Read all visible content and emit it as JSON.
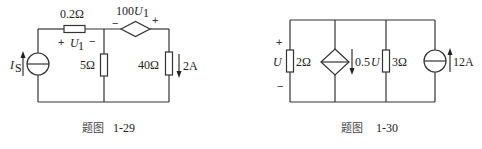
{
  "figures": [
    {
      "id": "fig-1-29",
      "caption_prefix": "题图",
      "caption_number": "1-29",
      "components": {
        "current_source": {
          "label_main": "I",
          "label_sub": "S",
          "direction": "up"
        },
        "series_resistor": {
          "value": "0.2Ω",
          "voltage_label_main": "U",
          "voltage_label_sub": "1",
          "plus": "+",
          "minus": "−"
        },
        "shunt_resistor": {
          "value": "5Ω"
        },
        "dependent_voltage_source": {
          "label_prefix": "100",
          "label_main": "U",
          "label_sub": "1",
          "minus": "−",
          "plus": "+"
        },
        "load_resistor": {
          "value": "40Ω",
          "current_label": "2A",
          "current_direction": "down"
        }
      }
    },
    {
      "id": "fig-1-30",
      "caption_prefix": "题图",
      "caption_number": "1-30",
      "components": {
        "voltage_label": {
          "main": "U",
          "plus": "+",
          "minus": "−"
        },
        "resistor_1": {
          "value": "2Ω"
        },
        "dependent_current_source": {
          "label_prefix": "0.5",
          "label_main": "U",
          "direction": "down"
        },
        "resistor_2": {
          "value": "3Ω"
        },
        "current_source": {
          "value": "12A",
          "direction": "up"
        }
      }
    }
  ]
}
